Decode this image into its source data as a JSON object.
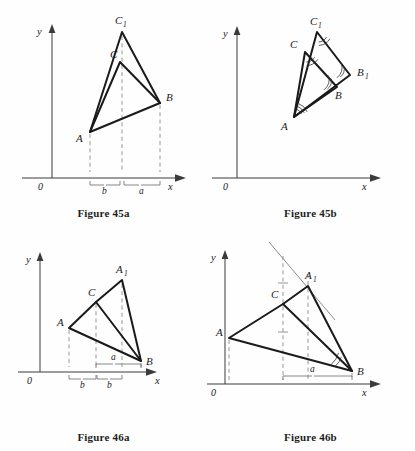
{
  "page": {
    "background_color": "#fefefe",
    "ink_color": "#1a1a1a",
    "dashed_color": "#8d8d8d"
  },
  "figures": [
    {
      "id": "45a",
      "caption": "Figure 45a",
      "axes": {
        "y_label": "y",
        "x_label": "x",
        "origin_label": "0"
      },
      "vertex_labels": [
        {
          "name": "C1",
          "base": "C",
          "sub": "1"
        },
        {
          "name": "C",
          "base": "C",
          "sub": ""
        },
        {
          "name": "B",
          "base": "B",
          "sub": ""
        },
        {
          "name": "A",
          "base": "A",
          "sub": ""
        }
      ],
      "measures": [
        {
          "label": "b",
          "position": "below-axis"
        },
        {
          "label": "a",
          "position": "below-axis"
        }
      ]
    },
    {
      "id": "45b",
      "caption": "Figure 45b",
      "axes": {
        "y_label": "y",
        "x_label": "x",
        "origin_label": "0"
      },
      "vertex_labels": [
        {
          "name": "C1",
          "base": "C",
          "sub": "1"
        },
        {
          "name": "C",
          "base": "C",
          "sub": ""
        },
        {
          "name": "B1",
          "base": "B",
          "sub": "1"
        },
        {
          "name": "B",
          "base": "B",
          "sub": ""
        },
        {
          "name": "A",
          "base": "A",
          "sub": ""
        }
      ],
      "measures": []
    },
    {
      "id": "46a",
      "caption": "Figure 46a",
      "axes": {
        "y_label": "y",
        "x_label": "x",
        "origin_label": "0"
      },
      "vertex_labels": [
        {
          "name": "A1",
          "base": "A",
          "sub": "1"
        },
        {
          "name": "C",
          "base": "C",
          "sub": ""
        },
        {
          "name": "A",
          "base": "A",
          "sub": ""
        },
        {
          "name": "B",
          "base": "B",
          "sub": ""
        }
      ],
      "measures": [
        {
          "label": "a",
          "position": "above-axis"
        },
        {
          "label": "b",
          "position": "below-axis"
        },
        {
          "label": "b",
          "position": "below-axis"
        }
      ]
    },
    {
      "id": "46b",
      "caption": "Figure 46b",
      "axes": {
        "y_label": "y",
        "x_label": "x",
        "origin_label": "0"
      },
      "vertex_labels": [
        {
          "name": "A1",
          "base": "A",
          "sub": "1"
        },
        {
          "name": "C",
          "base": "C",
          "sub": ""
        },
        {
          "name": "A",
          "base": "A",
          "sub": ""
        },
        {
          "name": "B",
          "base": "B",
          "sub": ""
        }
      ],
      "measures": [
        {
          "label": "a",
          "position": "above-axis"
        }
      ]
    }
  ]
}
